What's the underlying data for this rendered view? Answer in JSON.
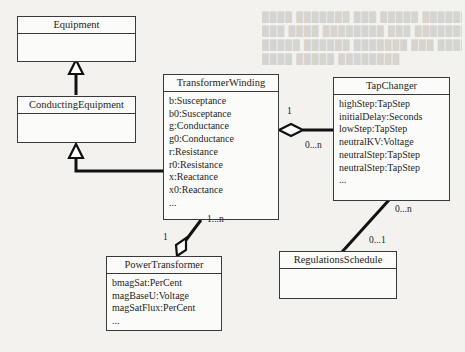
{
  "diagram": {
    "type": "UML class diagram",
    "classes": {
      "equipment": {
        "name": "Equipment",
        "attributes": []
      },
      "conducting_equipment": {
        "name": "ConductingEquipment",
        "attributes": []
      },
      "transformer_winding": {
        "name": "TransformerWinding",
        "attributes": [
          "b:Susceptance",
          "b0:Susceptance",
          "g:Conductance",
          "g0:Conductance",
          "r:Resistance",
          "r0:Resistance",
          "x:Reactance",
          "x0:Reactance",
          "..."
        ]
      },
      "tap_changer": {
        "name": "TapChanger",
        "attributes": [
          "highStep:TapStep",
          "initialDelay:Seconds",
          "lowStep:TapStep",
          "neutralKV:Voltage",
          "neutralStep:TapStep",
          "neutralStep:TapStep",
          "..."
        ]
      },
      "power_transformer": {
        "name": "PowerTransformer",
        "attributes": [
          "bmagSat:PerCent",
          "magBaseU:Voltage",
          "magSatFlux:PerCent",
          "..."
        ]
      },
      "regulations_schedule": {
        "name": "RegulationsSchedule",
        "attributes": []
      }
    },
    "relations": [
      {
        "type": "generalization",
        "from": "ConductingEquipment",
        "to": "Equipment"
      },
      {
        "type": "generalization",
        "from": "TransformerWinding",
        "to": "ConductingEquipment"
      },
      {
        "type": "aggregation",
        "whole": "TransformerWinding",
        "part": "TapChanger",
        "whole_mult": "1",
        "part_mult": "0...n"
      },
      {
        "type": "aggregation",
        "whole": "PowerTransformer",
        "part": "TransformerWinding",
        "whole_mult": "1",
        "part_mult": "1...n"
      },
      {
        "type": "association",
        "from": "TapChanger",
        "to": "RegulationsSchedule",
        "from_mult": "0...n",
        "to_mult": "0...1"
      }
    ],
    "multiplicities": {
      "tw_tc_one": "1",
      "tw_tc_many": "0...n",
      "pt_tw_many": "1...n",
      "pt_tw_one": "1",
      "tc_rs_many": "0...n",
      "tc_rs_one": "0...1"
    }
  }
}
